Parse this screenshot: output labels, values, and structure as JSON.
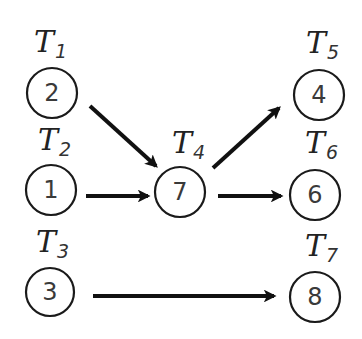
{
  "diagram": {
    "type": "task-graph",
    "nodes": [
      {
        "id": "n2",
        "value": "2",
        "label": "T",
        "sub": "1",
        "cx": 52,
        "cy": 93
      },
      {
        "id": "n1",
        "value": "1",
        "label": "T",
        "sub": "2",
        "cx": 51,
        "cy": 190
      },
      {
        "id": "n3",
        "value": "3",
        "label": "T",
        "sub": "3",
        "cx": 50,
        "cy": 292
      },
      {
        "id": "n7",
        "value": "7",
        "label": "T",
        "sub": "4",
        "cx": 180,
        "cy": 192
      },
      {
        "id": "n4",
        "value": "4",
        "label": "T",
        "sub": "5",
        "cx": 319,
        "cy": 95
      },
      {
        "id": "n6",
        "value": "6",
        "label": "T",
        "sub": "6",
        "cx": 315,
        "cy": 195
      },
      {
        "id": "n8",
        "value": "8",
        "label": "T",
        "sub": "7",
        "cx": 315,
        "cy": 297
      }
    ],
    "edges": [
      {
        "from": "T1",
        "to": "T4"
      },
      {
        "from": "T2",
        "to": "T4"
      },
      {
        "from": "T4",
        "to": "T5"
      },
      {
        "from": "T4",
        "to": "T6"
      },
      {
        "from": "T3",
        "to": "T7"
      }
    ],
    "colors": {
      "stroke": "#111111",
      "background": "#ffffff"
    }
  }
}
